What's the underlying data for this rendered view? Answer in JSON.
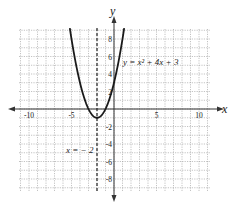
{
  "chart_data": {
    "type": "line",
    "title": "",
    "function": "y = x² + 4x + 3",
    "equation_label": "y = x² + 4x + 3",
    "axis_of_symmetry_label": "x = − 2",
    "axis_of_symmetry_x": -2,
    "vertex": [
      -2,
      -1
    ],
    "xlabel": "x",
    "ylabel": "y",
    "xlim": [
      -11,
      11
    ],
    "ylim": [
      -9,
      9.5
    ],
    "x_ticks": [
      -10,
      -5,
      5,
      10
    ],
    "x_tick_labels": [
      "-10",
      "-5",
      "5",
      "10"
    ],
    "y_ticks": [
      8,
      6,
      4,
      2,
      -2,
      -4,
      -6,
      -8
    ],
    "y_tick_labels": [
      "8",
      "6",
      "4",
      "2",
      "-2",
      "-4",
      "-6",
      "-8"
    ],
    "grid": true,
    "grid_style": "dotted",
    "series": [
      {
        "name": "y = x^2 + 4x + 3",
        "x": [
          -5.2,
          -5,
          -4,
          -3,
          -2,
          -1,
          0,
          1,
          1.2
        ],
        "values": [
          9.24,
          8,
          3,
          0,
          -1,
          0,
          3,
          8,
          9.24
        ]
      }
    ]
  }
}
